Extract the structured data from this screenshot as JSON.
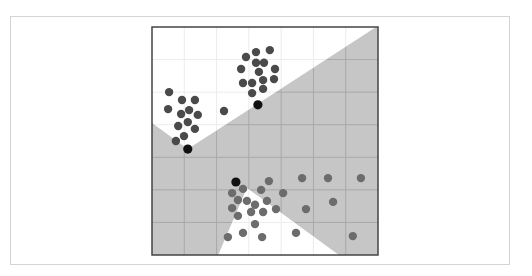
{
  "chart_data": {
    "type": "scatter",
    "title": "",
    "xlabel": "",
    "ylabel": "",
    "xlim": [
      0,
      7
    ],
    "ylim": [
      0,
      7
    ],
    "grid": true,
    "grid_divisions": 7,
    "legend": "none",
    "colors": {
      "region_fill": "#c6c6c6",
      "region_grid": "#a9a9a9",
      "background_grid": "#ececec",
      "plot_border": "#444444",
      "cluster_a": "#4a4a4a",
      "cluster_b": "#6c6c6c",
      "centroid": "#111111"
    },
    "regions": [
      {
        "name": "upper-white-region",
        "fill": "white",
        "polygon": [
          [
            0,
            7
          ],
          [
            6.94,
            7
          ],
          [
            1.11,
            3.25
          ],
          [
            0,
            4.05
          ]
        ]
      },
      {
        "name": "lower-white-region",
        "fill": "white",
        "polygon": [
          [
            2.94,
            2.06
          ],
          [
            5.79,
            0
          ],
          [
            2.05,
            0
          ]
        ]
      }
    ],
    "series": [
      {
        "name": "cluster-upper-right",
        "color_key": "cluster_a",
        "points": [
          [
            2.91,
            6.08
          ],
          [
            3.22,
            6.23
          ],
          [
            3.65,
            6.29
          ],
          [
            3.22,
            5.9
          ],
          [
            3.47,
            5.9
          ],
          [
            2.76,
            5.71
          ],
          [
            3.31,
            5.62
          ],
          [
            3.81,
            5.71
          ],
          [
            2.82,
            5.28
          ],
          [
            3.1,
            5.28
          ],
          [
            3.44,
            5.37
          ],
          [
            3.78,
            5.4
          ],
          [
            3.1,
            4.97
          ],
          [
            3.44,
            5.1
          ]
        ]
      },
      {
        "name": "cluster-upper-left",
        "color_key": "cluster_a",
        "points": [
          [
            0.53,
            5.0
          ],
          [
            0.93,
            4.76
          ],
          [
            1.33,
            4.76
          ],
          [
            0.5,
            4.48
          ],
          [
            1.15,
            4.45
          ],
          [
            0.9,
            4.33
          ],
          [
            1.42,
            4.3
          ],
          [
            2.23,
            4.42
          ],
          [
            0.81,
            3.96
          ],
          [
            1.11,
            4.08
          ],
          [
            1.33,
            3.87
          ],
          [
            0.99,
            3.65
          ],
          [
            0.74,
            3.5
          ]
        ]
      },
      {
        "name": "cluster-lower",
        "color_key": "cluster_b",
        "points": [
          [
            3.62,
            2.27
          ],
          [
            2.48,
            1.9
          ],
          [
            2.82,
            2.03
          ],
          [
            3.38,
            2.0
          ],
          [
            4.06,
            1.9
          ],
          [
            2.66,
            1.69
          ],
          [
            2.94,
            1.66
          ],
          [
            3.56,
            1.66
          ],
          [
            3.19,
            1.54
          ],
          [
            2.48,
            1.44
          ],
          [
            3.07,
            1.32
          ],
          [
            3.44,
            1.32
          ],
          [
            3.84,
            1.41
          ],
          [
            2.66,
            1.2
          ],
          [
            3.19,
            0.95
          ],
          [
            2.35,
            0.55
          ],
          [
            2.82,
            0.68
          ],
          [
            3.41,
            0.55
          ],
          [
            4.46,
            0.68
          ],
          [
            4.65,
            2.36
          ],
          [
            5.45,
            2.36
          ],
          [
            6.47,
            2.36
          ],
          [
            5.61,
            1.63
          ],
          [
            4.77,
            1.41
          ],
          [
            6.22,
            0.58
          ]
        ]
      },
      {
        "name": "centroids",
        "color_key": "centroid",
        "points": [
          [
            3.28,
            4.61
          ],
          [
            1.11,
            3.25
          ],
          [
            2.6,
            2.24
          ]
        ]
      }
    ]
  }
}
